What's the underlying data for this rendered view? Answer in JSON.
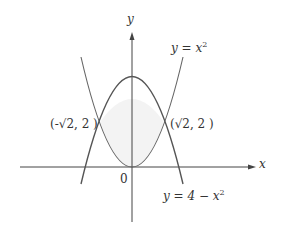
{
  "axes": {
    "x_label": "x",
    "y_label": "y",
    "origin_label": "0"
  },
  "curves": [
    {
      "name": "upward-parabola",
      "equation": "y = x²",
      "label_lhs": "y = x",
      "label_exp": "2"
    },
    {
      "name": "downward-parabola",
      "equation": "y = 4 − x²",
      "label_lhs": "y = 4 − x",
      "label_exp": "2"
    }
  ],
  "points": [
    {
      "label": "(-√2, 2 )"
    },
    {
      "label": "(√2, 2 )"
    }
  ],
  "colors": {
    "stroke": "#555555",
    "fill": "#f4f4f4",
    "axis": "#333333"
  }
}
